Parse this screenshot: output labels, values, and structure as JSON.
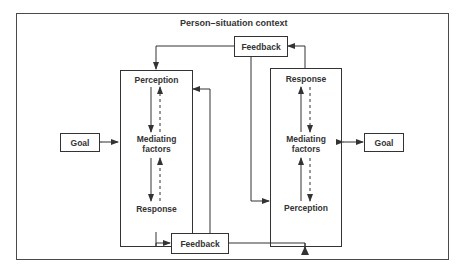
{
  "diagram": {
    "context_label": "Person–situation context",
    "left_system": {
      "top": "Perception",
      "middle": [
        "Mediating",
        "factors"
      ],
      "bottom": "Response"
    },
    "right_system": {
      "top": "Response",
      "middle": [
        "Mediating",
        "factors"
      ],
      "bottom": "Perception"
    },
    "left_goal": "Goal",
    "right_goal": "Goal",
    "top_feedback": "Feedback",
    "bottom_feedback": "Feedback",
    "colors": {
      "line": "#333333",
      "frame": "#4a4a4a",
      "text": "#333333"
    }
  }
}
